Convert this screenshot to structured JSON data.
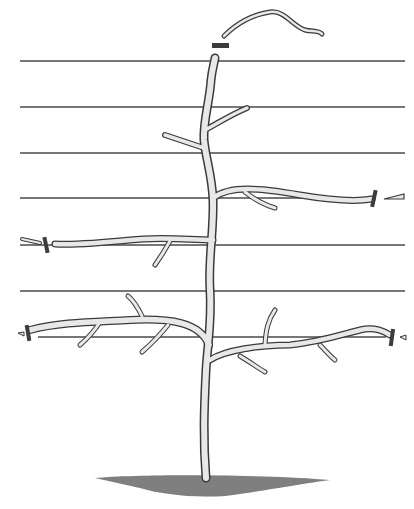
{
  "illustration": {
    "title": "Horizontal espalier tree trained on wires",
    "subject": "espalier-tree",
    "colors": {
      "background": "#ffffff",
      "wire": "#4a4a4a",
      "bark_outline": "#3a3a3a",
      "bark_fill": "#e8e8e8",
      "tie": "#3c3c3c",
      "soil": "#555555"
    },
    "wires": [
      {
        "y": 61,
        "x1": 20,
        "x2": 405
      },
      {
        "y": 107,
        "x1": 20,
        "x2": 405
      },
      {
        "y": 153,
        "x1": 20,
        "x2": 405
      },
      {
        "y": 198,
        "x1": 20,
        "x2": 405
      },
      {
        "y": 245,
        "x1": 20,
        "x2": 405
      },
      {
        "y": 291,
        "x1": 20,
        "x2": 405
      },
      {
        "y": 337,
        "x1": 20,
        "x2": 405
      }
    ],
    "tiers": [
      {
        "name": "upper-tier",
        "side": "right",
        "wire_y": 198,
        "tie_x": 374
      },
      {
        "name": "middle-tier",
        "side": "left",
        "wire_y": 245,
        "tie_x": 46
      },
      {
        "name": "lower-tier-left",
        "side": "left",
        "wire_y": 337,
        "tie_x": 28
      },
      {
        "name": "lower-tier-right",
        "side": "right",
        "wire_y": 337,
        "tie_x": 392
      }
    ],
    "leader_tie": {
      "x": 212,
      "y": 44,
      "w": 17,
      "h": 5
    },
    "icons": [
      "tree-trunk-icon",
      "cut-shoot-icon",
      "wire-tie-icon",
      "soil-mound-icon"
    ]
  }
}
